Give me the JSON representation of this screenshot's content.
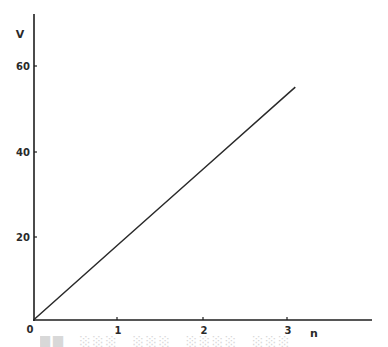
{
  "chart_data": {
    "type": "line",
    "title": "",
    "xlabel": "n",
    "ylabel": "V",
    "xlim": [
      0,
      4.0
    ],
    "ylim": [
      0,
      70
    ],
    "x_ticks": [
      "0",
      "1",
      "2",
      "3"
    ],
    "y_ticks": [
      "20",
      "40",
      "60"
    ],
    "origin_label": "0",
    "grid": false,
    "legend": null,
    "series": [
      {
        "name": "V vs n",
        "x": [
          0,
          1,
          2,
          3,
          3.08
        ],
        "y": [
          0,
          17.8,
          35.6,
          53.4,
          54.8
        ]
      }
    ]
  },
  "axes": {
    "x_label": "n",
    "y_label": "V",
    "origin": "0",
    "x_tick_labels": [
      "1",
      "2",
      "3"
    ],
    "y_tick_labels": [
      "20",
      "40",
      "60"
    ]
  },
  "colors": {
    "line": "#2a2a2a",
    "axis": "#1e1e1e",
    "background": "#ffffff"
  }
}
